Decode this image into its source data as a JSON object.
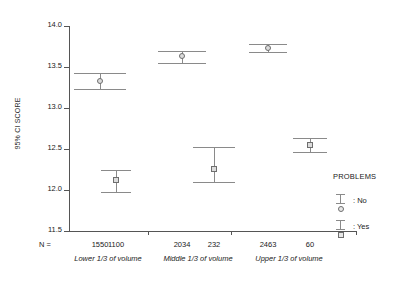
{
  "chart_data": {
    "type": "scatter",
    "title": "",
    "xlabel": "",
    "ylabel": "95% CI SCORE",
    "ylim": [
      11.5,
      14.0
    ],
    "ytick_labels": [
      "14.0",
      "13.5",
      "13.0",
      "12.5",
      "12.0",
      "11.5"
    ],
    "ytick_values": [
      14.0,
      13.5,
      13.0,
      12.5,
      12.0,
      11.5
    ],
    "grid": false,
    "legend_position": "right",
    "legend_title": "PROBLEMS",
    "categories": [
      "Lower 1/3 of volume",
      "Middle 1/3 of volume",
      "Upper 1/3 of volume"
    ],
    "series": [
      {
        "name": "No",
        "marker": "circle",
        "values": [
          13.33,
          13.63,
          13.73
        ],
        "ci_low": [
          13.23,
          13.55,
          13.68
        ],
        "ci_high": [
          13.43,
          13.7,
          13.78
        ],
        "n": [
          1550,
          2034,
          2463
        ]
      },
      {
        "name": "Yes",
        "marker": "square",
        "values": [
          12.12,
          12.26,
          12.55
        ],
        "ci_low": [
          11.98,
          12.1,
          12.46
        ],
        "ci_high": [
          12.25,
          12.53,
          12.63
        ],
        "n": [
          1100,
          232,
          60
        ]
      }
    ],
    "n_row_label": "N =",
    "n_values": [
      1550,
      1100,
      2034,
      232,
      2463,
      60
    ]
  },
  "axis": {
    "y_title": "95% CI SCORE",
    "y_ticks": [
      {
        "label": "14.0",
        "value": 14.0
      },
      {
        "label": "13.5",
        "value": 13.5
      },
      {
        "label": "13.0",
        "value": 13.0
      },
      {
        "label": "12.5",
        "value": 12.5
      },
      {
        "label": "12.0",
        "value": 12.0
      },
      {
        "label": "11.5",
        "value": 11.5
      }
    ]
  },
  "n_row": {
    "prefix": "N =",
    "entries": [
      "1550",
      "1100",
      "2034",
      "232",
      "2463",
      "60"
    ]
  },
  "group_labels": [
    "Lower 1/3 of volume",
    "Middle 1/3 of volume",
    "Upper 1/3 of volume"
  ],
  "legend": {
    "title": "PROBLEMS",
    "entries": [
      {
        "label": ": No",
        "marker": "circle"
      },
      {
        "label": ": Yes",
        "marker": "square"
      }
    ]
  },
  "colors": {
    "axis": "#555555",
    "errorbar": "#8a8a8a",
    "marker_edge": "#6e6e6e",
    "marker_fill": "#dcdcdc",
    "text": "#1a1a1a",
    "background": "#ffffff"
  }
}
